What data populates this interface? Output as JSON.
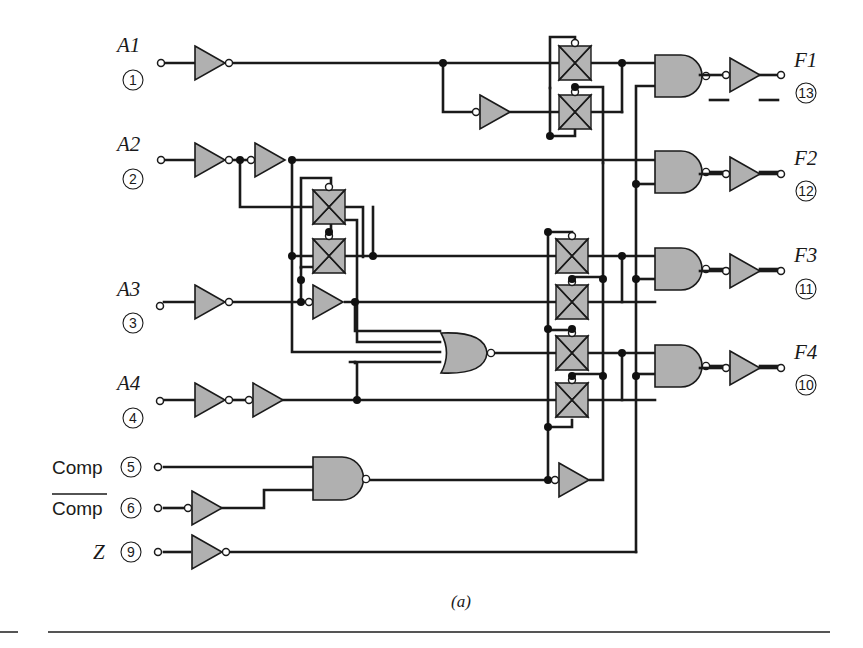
{
  "figure": {
    "caption": "(a)"
  },
  "inputs": [
    {
      "label": "A1",
      "pin": "1"
    },
    {
      "label": "A2",
      "pin": "2"
    },
    {
      "label": "A3",
      "pin": "3"
    },
    {
      "label": "A4",
      "pin": "4"
    },
    {
      "label": "Comp",
      "pin": "5",
      "overbar": false
    },
    {
      "label": "Comp",
      "pin": "6",
      "overbar": true
    },
    {
      "label": "Z",
      "pin": "9"
    }
  ],
  "outputs": [
    {
      "label": "F1",
      "pin": "13"
    },
    {
      "label": "F2",
      "pin": "12"
    },
    {
      "label": "F3",
      "pin": "11"
    },
    {
      "label": "F4",
      "pin": "10"
    }
  ],
  "components": {
    "inverters": 11,
    "transmission_gates": 8,
    "nor_gates": 1,
    "nand_gates": 5,
    "output_buffers": 4
  },
  "colors": {
    "gate_fill": "#b0b0b0",
    "wire": "#1a1a1a",
    "background": "#ffffff"
  }
}
